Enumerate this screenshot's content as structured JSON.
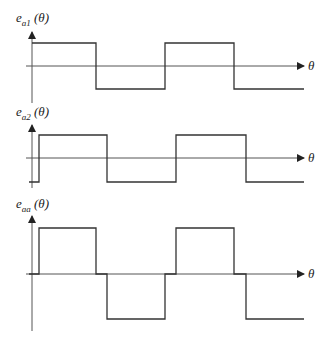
{
  "panels": [
    {
      "label_main": "e",
      "label_sub": "a1",
      "label_arg": " (θ)",
      "x_label": "θ",
      "axis": {
        "x": 32,
        "y_top": 32,
        "y_bottom": 103,
        "zero_y": 66,
        "x_end": 304
      },
      "waveform": "M32,43 L96,43 L96,89 L165,89 L165,43 L234,43 L234,89 L304,89",
      "label_pos": {
        "x": 16,
        "y": 10
      },
      "theta_pos": {
        "x": 308,
        "y": 58
      }
    },
    {
      "label_main": "e",
      "label_sub": "a2",
      "label_arg": " (θ)",
      "x_label": "θ",
      "axis": {
        "x": 32,
        "y_top": 125,
        "y_bottom": 188,
        "zero_y": 158,
        "x_end": 304
      },
      "waveform": "M29,182 L39,182 L39,135 L107,135 L107,182 L176,182 L176,135 L246,135 L246,182 L304,182",
      "label_pos": {
        "x": 16,
        "y": 104
      },
      "theta_pos": {
        "x": 308,
        "y": 150
      }
    },
    {
      "label_main": "e",
      "label_sub": "aa",
      "label_arg": " (θ)",
      "x_label": "θ",
      "axis": {
        "x": 32,
        "y_top": 216,
        "y_bottom": 331,
        "zero_y": 274,
        "x_end": 304
      },
      "waveform": "M29,274 L39,274 L39,228 L96,228 L96,274 L107,274 L107,319 L165,319 L165,274 L176,274 L176,228 L234,228 L234,274 L246,274 L246,319 L304,319",
      "label_pos": {
        "x": 16,
        "y": 196
      },
      "theta_pos": {
        "x": 308,
        "y": 266
      }
    }
  ],
  "colors": {
    "line": "#333333",
    "axis": "#555555"
  }
}
